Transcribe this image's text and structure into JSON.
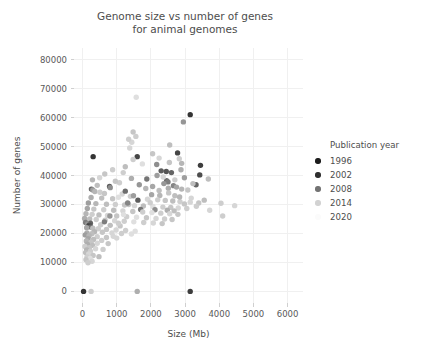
{
  "chart_data": {
    "type": "scatter",
    "title_line1": "Genome size vs number of genes",
    "title_line2": "for animal genomes",
    "xlabel": "Size (Mb)",
    "ylabel": "Number of genes",
    "xlim": [
      -250,
      6450
    ],
    "ylim": [
      -4000,
      84000
    ],
    "xticks": [
      0,
      1000,
      2000,
      3000,
      4000,
      5000,
      6000
    ],
    "xticklabels": [
      "0",
      "1000",
      "2000",
      "3000",
      "4000",
      "5000",
      "6000"
    ],
    "yticks": [
      0,
      10000,
      20000,
      30000,
      40000,
      50000,
      60000,
      70000,
      80000
    ],
    "yticklabels": [
      "0",
      "10000",
      "20000",
      "30000",
      "40000",
      "50000",
      "60000",
      "70000",
      "80000"
    ],
    "grid": true,
    "grid_color": "#f0f0f0",
    "background": "#ffffff",
    "legend": {
      "title": "Publication year",
      "position": "right",
      "entries": [
        {
          "label": "1996",
          "color": "#1c1c1c"
        },
        {
          "label": "2002",
          "color": "#303030"
        },
        {
          "label": "2008",
          "color": "#737373"
        },
        {
          "label": "2014",
          "color": "#d2d2d2"
        },
        {
          "label": "2020",
          "color": "#fbfbfb"
        }
      ]
    },
    "color_scale": {
      "variable": "Publication year",
      "min": 1993,
      "max": 2022,
      "dark_color": "#141414",
      "light_color": "#ffffff"
    },
    "points": [
      {
        "x": 30,
        "y": 0,
        "c": 1997
      },
      {
        "x": 250,
        "y": 0,
        "c": 2016
      },
      {
        "x": 1600,
        "y": 0,
        "c": 2012
      },
      {
        "x": 3150,
        "y": 0,
        "c": 1998
      },
      {
        "x": 310,
        "y": 46500,
        "c": 1997
      },
      {
        "x": 1600,
        "y": 46500,
        "c": 1999
      },
      {
        "x": 1570,
        "y": 67000,
        "c": 2018
      },
      {
        "x": 3150,
        "y": 61000,
        "c": 1997
      },
      {
        "x": 2950,
        "y": 58500,
        "c": 2009
      },
      {
        "x": 2780,
        "y": 47800,
        "c": 1999
      },
      {
        "x": 1480,
        "y": 55000,
        "c": 2015
      },
      {
        "x": 1440,
        "y": 51500,
        "c": 2017
      },
      {
        "x": 1350,
        "y": 52500,
        "c": 2016
      },
      {
        "x": 2170,
        "y": 43800,
        "c": 2008
      },
      {
        "x": 2900,
        "y": 44200,
        "c": 2013
      },
      {
        "x": 3450,
        "y": 43500,
        "c": 1998
      },
      {
        "x": 2880,
        "y": 42000,
        "c": 2012
      },
      {
        "x": 2300,
        "y": 41600,
        "c": 2002
      },
      {
        "x": 2450,
        "y": 41400,
        "c": 2001
      },
      {
        "x": 2600,
        "y": 41000,
        "c": 2003
      },
      {
        "x": 3430,
        "y": 40200,
        "c": 2000
      },
      {
        "x": 2180,
        "y": 40000,
        "c": 2010
      },
      {
        "x": 3680,
        "y": 38800,
        "c": 2014
      },
      {
        "x": 2460,
        "y": 38200,
        "c": 2004
      },
      {
        "x": 2500,
        "y": 37800,
        "c": 2006
      },
      {
        "x": 2380,
        "y": 37200,
        "c": 2009
      },
      {
        "x": 3320,
        "y": 36800,
        "c": 2003
      },
      {
        "x": 2660,
        "y": 36500,
        "c": 2007
      },
      {
        "x": 2750,
        "y": 36000,
        "c": 2011
      },
      {
        "x": 2510,
        "y": 35600,
        "c": 2012
      },
      {
        "x": 2900,
        "y": 35300,
        "c": 2013
      },
      {
        "x": 3080,
        "y": 35000,
        "c": 2015
      },
      {
        "x": 1080,
        "y": 37500,
        "c": 2016
      },
      {
        "x": 430,
        "y": 36600,
        "c": 2014
      },
      {
        "x": 790,
        "y": 36200,
        "c": 2002
      },
      {
        "x": 810,
        "y": 35800,
        "c": 2008
      },
      {
        "x": 260,
        "y": 35300,
        "c": 2003
      },
      {
        "x": 300,
        "y": 35000,
        "c": 2010
      },
      {
        "x": 360,
        "y": 34500,
        "c": 2013
      },
      {
        "x": 510,
        "y": 34200,
        "c": 2016
      },
      {
        "x": 640,
        "y": 33800,
        "c": 2015
      },
      {
        "x": 1160,
        "y": 33600,
        "c": 2017
      },
      {
        "x": 2020,
        "y": 33400,
        "c": 2011
      },
      {
        "x": 2260,
        "y": 33100,
        "c": 2013
      },
      {
        "x": 2700,
        "y": 33000,
        "c": 2014
      },
      {
        "x": 1400,
        "y": 32800,
        "c": 2016
      },
      {
        "x": 1050,
        "y": 32500,
        "c": 2018
      },
      {
        "x": 250,
        "y": 32400,
        "c": 2012
      },
      {
        "x": 560,
        "y": 32200,
        "c": 2014
      },
      {
        "x": 880,
        "y": 32000,
        "c": 2015
      },
      {
        "x": 1900,
        "y": 31800,
        "c": 2017
      },
      {
        "x": 2200,
        "y": 31600,
        "c": 2016
      },
      {
        "x": 2420,
        "y": 31400,
        "c": 2015
      },
      {
        "x": 2640,
        "y": 31200,
        "c": 2014
      },
      {
        "x": 2850,
        "y": 31000,
        "c": 2016
      },
      {
        "x": 3150,
        "y": 30800,
        "c": 2017
      },
      {
        "x": 3400,
        "y": 30500,
        "c": 2015
      },
      {
        "x": 4050,
        "y": 30400,
        "c": 2016
      },
      {
        "x": 4450,
        "y": 29600,
        "c": 2017
      },
      {
        "x": 170,
        "y": 30500,
        "c": 2010
      },
      {
        "x": 390,
        "y": 30300,
        "c": 2013
      },
      {
        "x": 700,
        "y": 30100,
        "c": 2014
      },
      {
        "x": 960,
        "y": 30000,
        "c": 2016
      },
      {
        "x": 1230,
        "y": 29800,
        "c": 2015
      },
      {
        "x": 1520,
        "y": 29600,
        "c": 2017
      },
      {
        "x": 1780,
        "y": 29500,
        "c": 2014
      },
      {
        "x": 2060,
        "y": 29300,
        "c": 2018
      },
      {
        "x": 2350,
        "y": 29100,
        "c": 2016
      },
      {
        "x": 2580,
        "y": 29000,
        "c": 2015
      },
      {
        "x": 2800,
        "y": 28800,
        "c": 2017
      },
      {
        "x": 3050,
        "y": 28600,
        "c": 2016
      },
      {
        "x": 1700,
        "y": 28300,
        "c": 2005
      },
      {
        "x": 2120,
        "y": 28200,
        "c": 2008
      },
      {
        "x": 2480,
        "y": 28000,
        "c": 2012
      },
      {
        "x": 2680,
        "y": 27800,
        "c": 2014
      },
      {
        "x": 140,
        "y": 28600,
        "c": 2011
      },
      {
        "x": 330,
        "y": 28400,
        "c": 2015
      },
      {
        "x": 620,
        "y": 28200,
        "c": 2016
      },
      {
        "x": 910,
        "y": 28000,
        "c": 2014
      },
      {
        "x": 1180,
        "y": 27800,
        "c": 2017
      },
      {
        "x": 1470,
        "y": 27600,
        "c": 2015
      },
      {
        "x": 1760,
        "y": 27400,
        "c": 2016
      },
      {
        "x": 2030,
        "y": 27200,
        "c": 2018
      },
      {
        "x": 2290,
        "y": 27000,
        "c": 2016
      },
      {
        "x": 2550,
        "y": 26800,
        "c": 2017
      },
      {
        "x": 2790,
        "y": 26600,
        "c": 2015
      },
      {
        "x": 100,
        "y": 26800,
        "c": 2013
      },
      {
        "x": 280,
        "y": 26600,
        "c": 2016
      },
      {
        "x": 480,
        "y": 26400,
        "c": 2014
      },
      {
        "x": 730,
        "y": 26200,
        "c": 2017
      },
      {
        "x": 1000,
        "y": 26000,
        "c": 2015
      },
      {
        "x": 1290,
        "y": 25800,
        "c": 2016
      },
      {
        "x": 1580,
        "y": 25600,
        "c": 2018
      },
      {
        "x": 1870,
        "y": 25400,
        "c": 2015
      },
      {
        "x": 2150,
        "y": 25200,
        "c": 2017
      },
      {
        "x": 2400,
        "y": 25000,
        "c": 2016
      },
      {
        "x": 2620,
        "y": 24800,
        "c": 2015
      },
      {
        "x": 60,
        "y": 25200,
        "c": 2012
      },
      {
        "x": 210,
        "y": 25000,
        "c": 2014
      },
      {
        "x": 400,
        "y": 24800,
        "c": 2016
      },
      {
        "x": 660,
        "y": 24600,
        "c": 2015
      },
      {
        "x": 940,
        "y": 24400,
        "c": 2017
      },
      {
        "x": 1220,
        "y": 24200,
        "c": 2016
      },
      {
        "x": 1500,
        "y": 24000,
        "c": 2018
      },
      {
        "x": 1790,
        "y": 23800,
        "c": 2016
      },
      {
        "x": 2070,
        "y": 23600,
        "c": 2017
      },
      {
        "x": 2330,
        "y": 23400,
        "c": 2015
      },
      {
        "x": 90,
        "y": 23800,
        "c": 2006
      },
      {
        "x": 230,
        "y": 23500,
        "c": 2003
      },
      {
        "x": 150,
        "y": 23200,
        "c": 2009
      },
      {
        "x": 200,
        "y": 22900,
        "c": 2001
      },
      {
        "x": 180,
        "y": 22500,
        "c": 1999
      },
      {
        "x": 240,
        "y": 22200,
        "c": 2004
      },
      {
        "x": 120,
        "y": 22000,
        "c": 2011
      },
      {
        "x": 300,
        "y": 21800,
        "c": 2014
      },
      {
        "x": 460,
        "y": 21600,
        "c": 2016
      },
      {
        "x": 700,
        "y": 21400,
        "c": 2015
      },
      {
        "x": 980,
        "y": 21200,
        "c": 2017
      },
      {
        "x": 1260,
        "y": 21000,
        "c": 2016
      },
      {
        "x": 1540,
        "y": 20800,
        "c": 2018
      },
      {
        "x": 1100,
        "y": 22600,
        "c": 2015
      },
      {
        "x": 810,
        "y": 22800,
        "c": 2014
      },
      {
        "x": 530,
        "y": 23000,
        "c": 2016
      },
      {
        "x": 350,
        "y": 20600,
        "c": 2013
      },
      {
        "x": 580,
        "y": 20400,
        "c": 2015
      },
      {
        "x": 860,
        "y": 20200,
        "c": 2017
      },
      {
        "x": 1140,
        "y": 20000,
        "c": 2016
      },
      {
        "x": 1430,
        "y": 19800,
        "c": 2018
      },
      {
        "x": 130,
        "y": 20200,
        "c": 2012
      },
      {
        "x": 270,
        "y": 19900,
        "c": 2014
      },
      {
        "x": 80,
        "y": 19500,
        "c": 2010
      },
      {
        "x": 190,
        "y": 19200,
        "c": 2013
      },
      {
        "x": 430,
        "y": 18900,
        "c": 2016
      },
      {
        "x": 700,
        "y": 18600,
        "c": 2015
      },
      {
        "x": 1000,
        "y": 18400,
        "c": 2017
      },
      {
        "x": 160,
        "y": 18200,
        "c": 2011
      },
      {
        "x": 320,
        "y": 17900,
        "c": 2014
      },
      {
        "x": 560,
        "y": 17600,
        "c": 2016
      },
      {
        "x": 110,
        "y": 17400,
        "c": 2013
      },
      {
        "x": 250,
        "y": 17000,
        "c": 2015
      },
      {
        "x": 430,
        "y": 16600,
        "c": 2017
      },
      {
        "x": 140,
        "y": 16300,
        "c": 2012
      },
      {
        "x": 290,
        "y": 15900,
        "c": 2014
      },
      {
        "x": 70,
        "y": 15500,
        "c": 2016
      },
      {
        "x": 200,
        "y": 15100,
        "c": 2015
      },
      {
        "x": 380,
        "y": 14700,
        "c": 2017
      },
      {
        "x": 120,
        "y": 14300,
        "c": 2013
      },
      {
        "x": 230,
        "y": 13900,
        "c": 2016
      },
      {
        "x": 90,
        "y": 13400,
        "c": 2014
      },
      {
        "x": 180,
        "y": 12900,
        "c": 2017
      },
      {
        "x": 310,
        "y": 12400,
        "c": 2015
      },
      {
        "x": 130,
        "y": 11900,
        "c": 2016
      },
      {
        "x": 220,
        "y": 11400,
        "c": 2018
      },
      {
        "x": 100,
        "y": 10900,
        "c": 2015
      },
      {
        "x": 280,
        "y": 10400,
        "c": 2017
      },
      {
        "x": 160,
        "y": 9900,
        "c": 2016
      },
      {
        "x": 480,
        "y": 12000,
        "c": 2014
      },
      {
        "x": 600,
        "y": 14500,
        "c": 2016
      },
      {
        "x": 750,
        "y": 16500,
        "c": 2015
      },
      {
        "x": 900,
        "y": 19000,
        "c": 2017
      },
      {
        "x": 1050,
        "y": 23500,
        "c": 2016
      },
      {
        "x": 1200,
        "y": 26500,
        "c": 2018
      },
      {
        "x": 1350,
        "y": 30000,
        "c": 2015
      },
      {
        "x": 640,
        "y": 24000,
        "c": 2006
      },
      {
        "x": 800,
        "y": 26000,
        "c": 2009
      },
      {
        "x": 1250,
        "y": 34600,
        "c": 2004
      },
      {
        "x": 1320,
        "y": 30500,
        "c": 2007
      },
      {
        "x": 1490,
        "y": 33000,
        "c": 2010
      },
      {
        "x": 1620,
        "y": 31500,
        "c": 2002
      },
      {
        "x": 1850,
        "y": 35500,
        "c": 2013
      },
      {
        "x": 1980,
        "y": 30600,
        "c": 2016
      },
      {
        "x": 2240,
        "y": 34800,
        "c": 2014
      },
      {
        "x": 2360,
        "y": 39500,
        "c": 2017
      },
      {
        "x": 2520,
        "y": 34000,
        "c": 2015
      },
      {
        "x": 2700,
        "y": 38500,
        "c": 2016
      },
      {
        "x": 2840,
        "y": 32600,
        "c": 2013
      },
      {
        "x": 2980,
        "y": 30200,
        "c": 2015
      },
      {
        "x": 3180,
        "y": 32200,
        "c": 2017
      },
      {
        "x": 3330,
        "y": 29400,
        "c": 2016
      },
      {
        "x": 3560,
        "y": 31500,
        "c": 2014
      },
      {
        "x": 3720,
        "y": 28000,
        "c": 2017
      },
      {
        "x": 4100,
        "y": 26000,
        "c": 2016
      },
      {
        "x": 2050,
        "y": 36200,
        "c": 2011
      },
      {
        "x": 1880,
        "y": 38800,
        "c": 2005
      },
      {
        "x": 1660,
        "y": 36800,
        "c": 2009
      },
      {
        "x": 1430,
        "y": 39000,
        "c": 2012
      },
      {
        "x": 1190,
        "y": 41000,
        "c": 2016
      },
      {
        "x": 960,
        "y": 38000,
        "c": 2015
      },
      {
        "x": 2980,
        "y": 39200,
        "c": 2010
      },
      {
        "x": 3230,
        "y": 37200,
        "c": 2014
      },
      {
        "x": 2830,
        "y": 45800,
        "c": 2016
      },
      {
        "x": 2540,
        "y": 44500,
        "c": 2015
      },
      {
        "x": 2240,
        "y": 46000,
        "c": 2017
      },
      {
        "x": 1750,
        "y": 44000,
        "c": 2018
      },
      {
        "x": 1480,
        "y": 45500,
        "c": 2016
      },
      {
        "x": 1250,
        "y": 43000,
        "c": 2014
      },
      {
        "x": 880,
        "y": 42000,
        "c": 2016
      },
      {
        "x": 650,
        "y": 40500,
        "c": 2015
      },
      {
        "x": 500,
        "y": 39200,
        "c": 2017
      },
      {
        "x": 290,
        "y": 38500,
        "c": 2013
      },
      {
        "x": 2050,
        "y": 47500,
        "c": 2015
      },
      {
        "x": 1380,
        "y": 49500,
        "c": 2017
      },
      {
        "x": 1560,
        "y": 53500,
        "c": 2016
      },
      {
        "x": 2550,
        "y": 50500,
        "c": 2014
      }
    ]
  }
}
